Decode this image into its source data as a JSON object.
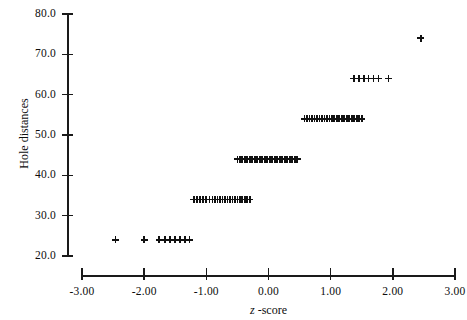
{
  "chart_data": {
    "type": "scatter",
    "title": "",
    "xlabel": "z -score",
    "ylabel": "Hole distances",
    "xlim": [
      -3.0,
      3.0
    ],
    "ylim": [
      20.0,
      80.0
    ],
    "grid": false,
    "legend": null,
    "xticks": [
      -3.0,
      -2.0,
      -1.0,
      0.0,
      1.0,
      2.0,
      3.0
    ],
    "xticklabels": [
      "-3.00",
      "-2.00",
      "-1.00",
      "0.00",
      "1.00",
      "2.00",
      "3.00"
    ],
    "yticks": [
      20.0,
      30.0,
      40.0,
      50.0,
      60.0,
      70.0,
      80.0
    ],
    "yticklabels": [
      "20.0",
      "30.0",
      "40.0",
      "50.0",
      "60.0",
      "70.0",
      "80.0"
    ],
    "marker": "plus",
    "marker_color": "#111111",
    "series": [
      {
        "name": "hole distances vs z-score",
        "points": [
          [
            -2.46,
            24.0
          ],
          [
            -2.0,
            24.0
          ],
          [
            -1.76,
            24.0
          ],
          [
            -1.67,
            24.0
          ],
          [
            -1.58,
            24.0
          ],
          [
            -1.5,
            24.0
          ],
          [
            -1.42,
            24.0
          ],
          [
            -1.34,
            24.0
          ],
          [
            -1.27,
            24.0
          ],
          [
            -1.2,
            34.0
          ],
          [
            -1.15,
            34.0
          ],
          [
            -1.1,
            34.0
          ],
          [
            -1.05,
            34.0
          ],
          [
            -1.0,
            34.0
          ],
          [
            -0.95,
            34.0
          ],
          [
            -0.9,
            34.0
          ],
          [
            -0.86,
            34.0
          ],
          [
            -0.82,
            34.0
          ],
          [
            -0.78,
            34.0
          ],
          [
            -0.74,
            34.0
          ],
          [
            -0.7,
            34.0
          ],
          [
            -0.66,
            34.0
          ],
          [
            -0.62,
            34.0
          ],
          [
            -0.58,
            34.0
          ],
          [
            -0.54,
            34.0
          ],
          [
            -0.5,
            34.0
          ],
          [
            -0.46,
            34.0
          ],
          [
            -0.42,
            34.0
          ],
          [
            -0.38,
            34.0
          ],
          [
            -0.34,
            34.0
          ],
          [
            -0.3,
            34.0
          ],
          [
            -0.5,
            44.0
          ],
          [
            -0.46,
            44.0
          ],
          [
            -0.42,
            44.0
          ],
          [
            -0.38,
            44.0
          ],
          [
            -0.34,
            44.0
          ],
          [
            -0.3,
            44.0
          ],
          [
            -0.26,
            44.0
          ],
          [
            -0.22,
            44.0
          ],
          [
            -0.18,
            44.0
          ],
          [
            -0.14,
            44.0
          ],
          [
            -0.1,
            44.0
          ],
          [
            -0.06,
            44.0
          ],
          [
            -0.02,
            44.0
          ],
          [
            0.02,
            44.0
          ],
          [
            0.06,
            44.0
          ],
          [
            0.1,
            44.0
          ],
          [
            0.14,
            44.0
          ],
          [
            0.18,
            44.0
          ],
          [
            0.22,
            44.0
          ],
          [
            0.26,
            44.0
          ],
          [
            0.3,
            44.0
          ],
          [
            0.34,
            44.0
          ],
          [
            0.38,
            44.0
          ],
          [
            0.42,
            44.0
          ],
          [
            0.46,
            44.0
          ],
          [
            0.58,
            54.0
          ],
          [
            0.62,
            54.0
          ],
          [
            0.66,
            54.0
          ],
          [
            0.7,
            54.0
          ],
          [
            0.74,
            54.0
          ],
          [
            0.78,
            54.0
          ],
          [
            0.82,
            54.0
          ],
          [
            0.86,
            54.0
          ],
          [
            0.9,
            54.0
          ],
          [
            0.94,
            54.0
          ],
          [
            0.98,
            54.0
          ],
          [
            1.02,
            54.0
          ],
          [
            1.06,
            54.0
          ],
          [
            1.1,
            54.0
          ],
          [
            1.14,
            54.0
          ],
          [
            1.18,
            54.0
          ],
          [
            1.22,
            54.0
          ],
          [
            1.26,
            54.0
          ],
          [
            1.3,
            54.0
          ],
          [
            1.34,
            54.0
          ],
          [
            1.38,
            54.0
          ],
          [
            1.42,
            54.0
          ],
          [
            1.46,
            54.0
          ],
          [
            1.5,
            54.0
          ],
          [
            1.37,
            64.0
          ],
          [
            1.45,
            64.0
          ],
          [
            1.53,
            64.0
          ],
          [
            1.61,
            64.0
          ],
          [
            1.69,
            64.0
          ],
          [
            1.77,
            64.0
          ],
          [
            1.93,
            64.0
          ],
          [
            2.45,
            74.0
          ]
        ]
      }
    ]
  },
  "axes": {
    "y_title": "Hole distances",
    "x_title_symbol": "z",
    "x_title_rest": " -score"
  }
}
